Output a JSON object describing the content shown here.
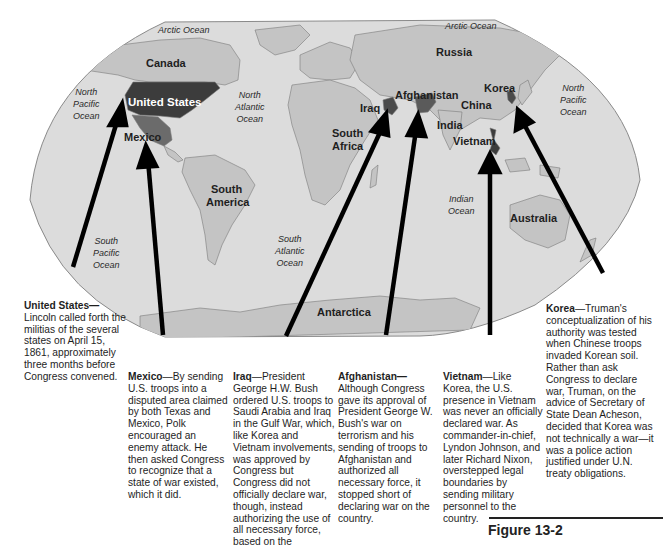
{
  "map": {
    "oceans": [
      {
        "id": "arctic-left",
        "label": "Arctic Ocean"
      },
      {
        "id": "arctic-right",
        "label": "Arctic Ocean"
      },
      {
        "id": "north-pacific-left",
        "label": "North\nPacific\nOcean"
      },
      {
        "id": "north-atlantic",
        "label": "North\nAtlantic\nOcean"
      },
      {
        "id": "north-pacific-right",
        "label": "North\nPacific\nOcean"
      },
      {
        "id": "south-pacific",
        "label": "South\nPacific\nOcean"
      },
      {
        "id": "south-atlantic",
        "label": "South\nAtlantic\nOcean"
      },
      {
        "id": "indian",
        "label": "Indian\nOcean"
      }
    ],
    "countries": {
      "canada": "Canada",
      "united_states": "United States",
      "mexico": "Mexico",
      "south_america": "South",
      "south_america_2": "America",
      "russia": "Russia",
      "afghanistan": "Afghanistan",
      "iraq": "Iraq",
      "korea": "Korea",
      "china": "China",
      "india": "India",
      "vietnam": "Vietnam",
      "south_africa": "South",
      "south_africa_2": "Africa",
      "australia": "Australia",
      "antarctica": "Antarctica"
    },
    "colors": {
      "ocean": "#dcdcdc",
      "land": "#c4c4c4",
      "highlight_dark": "#3c3c3c",
      "highlight_mid": "#6b6b6b",
      "border": "#7a7a7a"
    }
  },
  "captions": {
    "united_states": {
      "title": "United States—",
      "body": "Lincoln called forth the militias of the several states on April 15, 1861, approximately three months before Congress convened."
    },
    "mexico": {
      "title": "Mexico",
      "body": "—By sending U.S. troops into a disputed area claimed by both Texas and Mexico, Polk encouraged an enemy attack. He then asked Congress to recognize that a state of war existed, which it did."
    },
    "iraq": {
      "title": "Iraq",
      "body": "—President George H.W. Bush ordered U.S. troops to Saudi Arabia and Iraq in the Gulf War, which, like Korea and Vietnam involvements, was approved by Congress but Congress did not officially declare war, though, instead authorizing the use of all necessary force, based on the"
    },
    "afghanistan": {
      "title": "Afghanistan—",
      "body": "Although Congress gave its approval of President George W. Bush's war on terrorism and his sending of troops to Afghanistan and authorized all necessary force, it stopped short of declaring war on the country."
    },
    "vietnam": {
      "title": "Vietnam",
      "body": "—Like Korea, the U.S. presence in Vietnam was never an officially declared war. As commander-in-chief, Lyndon Johnson, and later Richard Nixon, overstepped legal boundaries by sending military personnel to the country."
    },
    "korea": {
      "title": "Korea",
      "body": "—Truman's conceptualization of his authority was tested when Chinese troops invaded Korean soil. Rather than ask Congress to declare war, Truman, on the advice of Secretary of State Dean Acheson, decided that Korea was not technically a war—it was a police action justified under U.N. treaty obligations."
    }
  },
  "figure": {
    "label": "Figure 13-2"
  }
}
